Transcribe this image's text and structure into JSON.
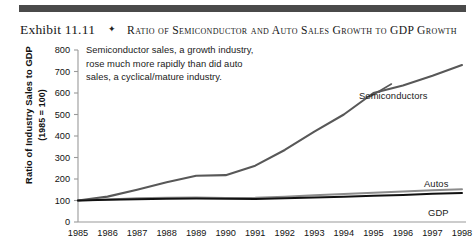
{
  "caption": {
    "exhibit_number": "Exhibit 11.11",
    "separator": "✦",
    "title": "Ratio of Semiconductor and Auto Sales Growth to GDP Growth"
  },
  "annotation": {
    "line1": "Semiconductor sales, a growth industry,",
    "line2": "rose much more rapidly than did auto",
    "line3": "sales, a cyclical/mature industry."
  },
  "axis": {
    "y_title_line1": "Ratio of Industry Sales to GDP",
    "y_title_line2": "(1985 = 100)"
  },
  "series_labels": {
    "semiconductors": "Semiconductors",
    "autos": "Autos",
    "gdp": "GDP"
  },
  "colors": {
    "rule": "#4a4a4a",
    "semiconductors": "#585858",
    "autos": "#8c8c8c",
    "gdp": "#111111",
    "axis": "#9a9a9a",
    "text": "#171717"
  },
  "chart_data": {
    "type": "line",
    "title": "Ratio of Semiconductor and Auto Sales Growth to GDP Growth",
    "xlabel": "",
    "ylabel": "Ratio of Industry Sales to GDP (1985 = 100)",
    "ylim": [
      0,
      800
    ],
    "yticks": [
      0,
      100,
      200,
      300,
      400,
      500,
      600,
      700,
      800
    ],
    "ytick_labels": [
      "0",
      "100",
      "200",
      "300",
      "400",
      "500",
      "600",
      "700",
      "800"
    ],
    "x": [
      1985,
      1986,
      1987,
      1988,
      1989,
      1990,
      1991,
      1992,
      1993,
      1994,
      1995,
      1996,
      1997,
      1998
    ],
    "xtick_labels": [
      "1985",
      "1986",
      "1987",
      "1988",
      "1989",
      "1990",
      "1991",
      "1992",
      "1993",
      "1994",
      "1995",
      "1996",
      "1997",
      "1998"
    ],
    "grid": false,
    "legend_position": "inline-right-of-series",
    "series": [
      {
        "name": "Semiconductors",
        "color": "#585858",
        "values": [
          100,
          118,
          150,
          185,
          215,
          218,
          262,
          335,
          420,
          500,
          600,
          635,
          680,
          730
        ]
      },
      {
        "name": "Autos",
        "color": "#8c8c8c",
        "values": [
          100,
          105,
          110,
          113,
          114,
          112,
          113,
          118,
          124,
          130,
          136,
          142,
          148,
          152
        ]
      },
      {
        "name": "GDP",
        "color": "#111111",
        "values": [
          100,
          103,
          106,
          108,
          109,
          108,
          107,
          110,
          114,
          118,
          122,
          126,
          131,
          135
        ]
      }
    ]
  }
}
